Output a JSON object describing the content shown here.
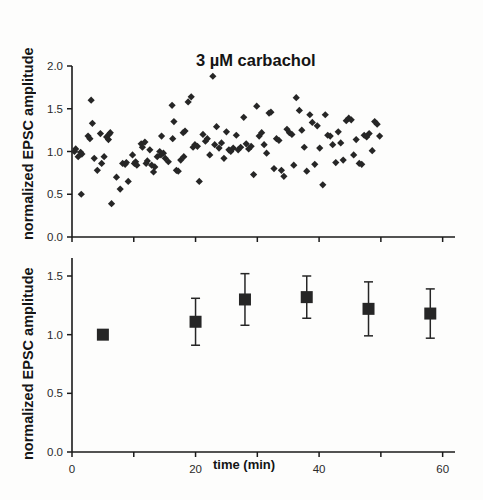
{
  "figure": {
    "background": "#fdfdfc",
    "ink": "#1a1a1a",
    "marker_color": "#262626"
  },
  "chart_data": [
    {
      "type": "scatter",
      "panel": "top",
      "title": "3 µM carbachol",
      "xlabel": "",
      "ylabel": "normalized EPSC amplitude",
      "xlim": [
        0,
        62
      ],
      "ylim": [
        0.0,
        2.0
      ],
      "yticks": [
        0.0,
        0.5,
        1.0,
        1.5,
        2.0
      ],
      "ytick_labels": [
        "0.0",
        "0.5",
        "1.0",
        "1.5",
        "2.0"
      ],
      "xticks": [
        0,
        10,
        20,
        30,
        40,
        50,
        60
      ],
      "xtick_labels": [],
      "grid": false,
      "legend": false,
      "marker": "diamond",
      "points": [
        [
          0.4,
          1.0
        ],
        [
          0.6,
          1.03
        ],
        [
          1.0,
          0.94
        ],
        [
          1.4,
          0.99
        ],
        [
          1.6,
          0.97
        ],
        [
          1.5,
          0.5
        ],
        [
          3.1,
          1.6
        ],
        [
          2.6,
          1.18
        ],
        [
          2.9,
          1.15
        ],
        [
          3.3,
          1.33
        ],
        [
          3.6,
          0.92
        ],
        [
          4.1,
          0.78
        ],
        [
          4.6,
          1.21
        ],
        [
          4.8,
          0.86
        ],
        [
          5.2,
          0.94
        ],
        [
          5.6,
          1.17
        ],
        [
          5.9,
          1.14
        ],
        [
          6.2,
          1.22
        ],
        [
          6.0,
          1.2
        ],
        [
          6.4,
          0.39
        ],
        [
          7.2,
          0.7
        ],
        [
          7.8,
          0.56
        ],
        [
          8.2,
          0.86
        ],
        [
          8.6,
          0.85
        ],
        [
          8.8,
          0.87
        ],
        [
          9.1,
          0.65
        ],
        [
          9.8,
          0.96
        ],
        [
          10.1,
          0.86
        ],
        [
          10.3,
          0.88
        ],
        [
          10.5,
          0.84
        ],
        [
          11.2,
          1.09
        ],
        [
          11.4,
          1.05
        ],
        [
          11.8,
          1.11
        ],
        [
          12.2,
          0.89
        ],
        [
          12.0,
          0.86
        ],
        [
          12.6,
          1.02
        ],
        [
          12.9,
          0.84
        ],
        [
          13.2,
          0.76
        ],
        [
          13.4,
          0.82
        ],
        [
          13.8,
          0.94
        ],
        [
          14.2,
          1.0
        ],
        [
          14.5,
          1.18
        ],
        [
          14.4,
          0.96
        ],
        [
          14.8,
          0.98
        ],
        [
          15.1,
          0.92
        ],
        [
          15.6,
          0.88
        ],
        [
          16.2,
          1.54
        ],
        [
          16.5,
          1.35
        ],
        [
          16.3,
          1.15
        ],
        [
          16.9,
          0.78
        ],
        [
          17.2,
          0.77
        ],
        [
          17.6,
          0.9
        ],
        [
          18.0,
          1.22
        ],
        [
          18.3,
          1.24
        ],
        [
          18.1,
          0.94
        ],
        [
          18.8,
          1.58
        ],
        [
          19.3,
          1.64
        ],
        [
          19.6,
          1.05
        ],
        [
          19.9,
          1.08
        ],
        [
          20.3,
          1.06
        ],
        [
          20.6,
          0.65
        ],
        [
          21.2,
          1.2
        ],
        [
          21.6,
          1.12
        ],
        [
          21.9,
          1.15
        ],
        [
          22.3,
          0.96
        ],
        [
          22.8,
          1.88
        ],
        [
          23.4,
          1.29
        ],
        [
          23.1,
          1.08
        ],
        [
          23.8,
          1.04
        ],
        [
          24.2,
          1.1
        ],
        [
          24.6,
          0.92
        ],
        [
          25.0,
          1.23
        ],
        [
          25.4,
          1.02
        ],
        [
          25.7,
          1.0
        ],
        [
          26.1,
          1.04
        ],
        [
          26.6,
          1.19
        ],
        [
          26.9,
          1.02
        ],
        [
          27.3,
          1.05
        ],
        [
          27.8,
          1.4
        ],
        [
          28.2,
          1.09
        ],
        [
          28.6,
          1.03
        ],
        [
          29.0,
          1.06
        ],
        [
          29.4,
          0.73
        ],
        [
          29.9,
          1.53
        ],
        [
          30.3,
          1.18
        ],
        [
          30.7,
          1.22
        ],
        [
          31.1,
          1.08
        ],
        [
          31.5,
          0.98
        ],
        [
          31.9,
          1.45
        ],
        [
          32.2,
          1.46
        ],
        [
          32.7,
          0.8
        ],
        [
          33.1,
          1.15
        ],
        [
          33.5,
          1.13
        ],
        [
          33.9,
          0.78
        ],
        [
          34.3,
          0.71
        ],
        [
          34.8,
          1.26
        ],
        [
          35.2,
          1.22
        ],
        [
          35.6,
          1.2
        ],
        [
          35.9,
          0.84
        ],
        [
          36.3,
          1.63
        ],
        [
          36.8,
          1.48
        ],
        [
          37.2,
          1.25
        ],
        [
          37.6,
          1.05
        ],
        [
          38.0,
          0.77
        ],
        [
          38.5,
          1.43
        ],
        [
          38.9,
          1.34
        ],
        [
          39.3,
          0.85
        ],
        [
          39.7,
          1.3
        ],
        [
          40.1,
          1.04
        ],
        [
          40.6,
          0.61
        ],
        [
          41.0,
          1.43
        ],
        [
          41.4,
          1.19
        ],
        [
          41.8,
          1.18
        ],
        [
          42.2,
          1.08
        ],
        [
          42.7,
          0.87
        ],
        [
          43.1,
          1.23
        ],
        [
          43.5,
          1.1
        ],
        [
          43.9,
          0.9
        ],
        [
          44.4,
          1.36
        ],
        [
          44.8,
          1.39
        ],
        [
          45.2,
          1.37
        ],
        [
          45.6,
          0.96
        ],
        [
          46.0,
          1.14
        ],
        [
          46.5,
          0.86
        ],
        [
          46.9,
          0.85
        ],
        [
          47.3,
          1.19
        ],
        [
          47.7,
          1.17
        ],
        [
          48.1,
          1.21
        ],
        [
          48.6,
          1.01
        ],
        [
          49.0,
          1.35
        ],
        [
          49.4,
          1.32
        ],
        [
          49.8,
          1.18
        ]
      ]
    },
    {
      "type": "scatter",
      "panel": "bottom",
      "title": "",
      "xlabel": "time (min)",
      "ylabel": "normalized EPSC amplitude",
      "xlim": [
        0,
        62
      ],
      "ylim": [
        0.0,
        1.65
      ],
      "yticks": [
        0.0,
        0.5,
        1.0,
        1.5
      ],
      "ytick_labels": [
        "0.0",
        "0.5",
        "1.0",
        "1.5"
      ],
      "xticks": [
        0,
        10,
        20,
        30,
        40,
        50,
        60
      ],
      "xtick_labels": [
        "0",
        "",
        "20",
        "",
        "40",
        "",
        "60"
      ],
      "grid": false,
      "legend": false,
      "marker": "square",
      "error_bars": true,
      "points": [
        {
          "x": 5,
          "y": 1.0,
          "err": 0.0
        },
        {
          "x": 20,
          "y": 1.11,
          "err": 0.2
        },
        {
          "x": 28,
          "y": 1.3,
          "err": 0.22
        },
        {
          "x": 38,
          "y": 1.32,
          "err": 0.18
        },
        {
          "x": 48,
          "y": 1.22,
          "err": 0.23
        },
        {
          "x": 58,
          "y": 1.18,
          "err": 0.21
        }
      ]
    }
  ]
}
